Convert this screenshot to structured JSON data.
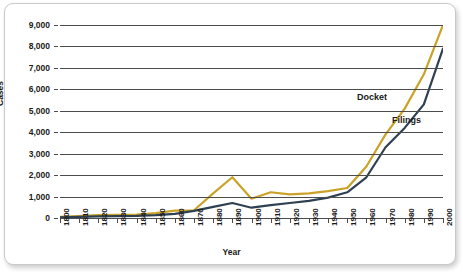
{
  "chart_data": {
    "type": "line",
    "title": "",
    "xlabel": "Year",
    "ylabel": "Cases",
    "xlim": [
      1800,
      2000
    ],
    "ylim": [
      0,
      9000
    ],
    "grid": true,
    "legend_position": "inline-right",
    "x": [
      1800,
      1810,
      1820,
      1830,
      1840,
      1850,
      1860,
      1870,
      1880,
      1890,
      1900,
      1910,
      1920,
      1930,
      1940,
      1950,
      1960,
      1970,
      1980,
      1990,
      2000
    ],
    "xtick_labels": [
      "1800",
      "1810",
      "1820",
      "1830",
      "1840",
      "1850",
      "1860",
      "1870",
      "1880",
      "1890",
      "1900",
      "1910",
      "1920",
      "1930",
      "1940",
      "1950",
      "1960",
      "1970",
      "1980",
      "1990",
      "2000"
    ],
    "ytick_labels": [
      "0",
      "1,000",
      "2,000",
      "3,000",
      "4,000",
      "5,000",
      "6,000",
      "7,000",
      "8,000",
      "9,000"
    ],
    "ytick_values": [
      0,
      1000,
      2000,
      3000,
      4000,
      5000,
      6000,
      7000,
      8000,
      9000
    ],
    "series": [
      {
        "name": "Docket",
        "color": "#C9A227",
        "values": [
          50,
          90,
          130,
          150,
          160,
          230,
          340,
          360,
          1150,
          1900,
          900,
          1200,
          1100,
          1150,
          1250,
          1400,
          2400,
          3900,
          5100,
          6700,
          9000
        ]
      },
      {
        "name": "Filings",
        "color": "#2E4052",
        "values": [
          30,
          55,
          75,
          85,
          95,
          130,
          190,
          330,
          520,
          700,
          480,
          600,
          700,
          800,
          950,
          1200,
          1900,
          3300,
          4200,
          5300,
          7900
        ]
      }
    ]
  },
  "axes": {
    "y_title": "Cases",
    "x_title": "Year"
  },
  "labels": {
    "docket": "Docket",
    "filings": "Filings"
  }
}
